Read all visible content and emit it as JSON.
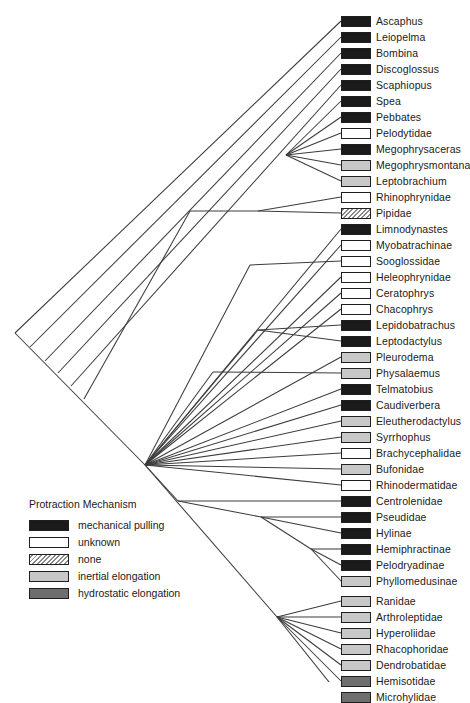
{
  "figure": {
    "type": "phylogenetic-tree-cladogram",
    "width": 464,
    "height": 682
  },
  "legend": {
    "title": "Protraction Mechanism",
    "items": [
      {
        "key": "mechanical-pulling",
        "label": "mechanical pulling",
        "color": "#1b1b1b",
        "pattern": "solid"
      },
      {
        "key": "unknown",
        "label": "unknown",
        "color": "#ffffff",
        "pattern": "solid"
      },
      {
        "key": "none",
        "label": "none",
        "color": "#ffffff",
        "pattern": "diagonal-hatch"
      },
      {
        "key": "inertial-elongation",
        "label": "inertial elongation",
        "color": "#c8c8c8",
        "pattern": "solid"
      },
      {
        "key": "hydrostatic-elongation",
        "label": "hydrostatic elongation",
        "color": "#6e6e6e",
        "pattern": "solid"
      }
    ]
  },
  "taxa": [
    {
      "label": "Ascaphus",
      "state": "mechanical-pulling",
      "x": 341,
      "y": 21
    },
    {
      "label": "Leiopelma",
      "state": "mechanical-pulling",
      "x": 341,
      "y": 37
    },
    {
      "label": "Bombina",
      "state": "mechanical-pulling",
      "x": 341,
      "y": 53
    },
    {
      "label": "Discoglossus",
      "state": "mechanical-pulling",
      "x": 341,
      "y": 69
    },
    {
      "label": "Scaphiopus",
      "state": "mechanical-pulling",
      "x": 341,
      "y": 85
    },
    {
      "label": "Spea",
      "state": "mechanical-pulling",
      "x": 341,
      "y": 101
    },
    {
      "label": "Pebbates",
      "state": "mechanical-pulling",
      "x": 341,
      "y": 117
    },
    {
      "label": "Pelodytidae",
      "state": "unknown",
      "x": 341,
      "y": 133
    },
    {
      "label": "Megophrysaceras",
      "state": "mechanical-pulling",
      "x": 341,
      "y": 149
    },
    {
      "label": "Megophrysmontana",
      "state": "inertial-elongation",
      "x": 341,
      "y": 165
    },
    {
      "label": "Leptobrachium",
      "state": "inertial-elongation",
      "x": 341,
      "y": 181
    },
    {
      "label": "Rhinophrynidae",
      "state": "unknown",
      "x": 341,
      "y": 197
    },
    {
      "label": "Pipidae",
      "state": "none",
      "x": 341,
      "y": 213
    },
    {
      "label": "Limnodynastes",
      "state": "mechanical-pulling",
      "x": 341,
      "y": 229
    },
    {
      "label": "Myobatrachinae",
      "state": "unknown",
      "x": 341,
      "y": 245
    },
    {
      "label": "Sooglossidae",
      "state": "unknown",
      "x": 341,
      "y": 261
    },
    {
      "label": "Heleophrynidae",
      "state": "unknown",
      "x": 341,
      "y": 277
    },
    {
      "label": "Ceratophrys",
      "state": "unknown",
      "x": 341,
      "y": 293
    },
    {
      "label": "Chacophrys",
      "state": "unknown",
      "x": 341,
      "y": 309
    },
    {
      "label": "Lepidobatrachus",
      "state": "mechanical-pulling",
      "x": 341,
      "y": 325
    },
    {
      "label": "Leptodactylus",
      "state": "mechanical-pulling",
      "x": 341,
      "y": 341
    },
    {
      "label": "Pleurodema",
      "state": "inertial-elongation",
      "x": 341,
      "y": 357
    },
    {
      "label": "Physalaemus",
      "state": "inertial-elongation",
      "x": 341,
      "y": 373
    },
    {
      "label": "Telmatobius",
      "state": "mechanical-pulling",
      "x": 341,
      "y": 389
    },
    {
      "label": "Caudiverbera",
      "state": "mechanical-pulling",
      "x": 341,
      "y": 405
    },
    {
      "label": "Eleutherodactylus",
      "state": "inertial-elongation",
      "x": 341,
      "y": 421
    },
    {
      "label": "Syrrhophus",
      "state": "inertial-elongation",
      "x": 341,
      "y": 437
    },
    {
      "label": "Brachycephalidae",
      "state": "unknown",
      "x": 341,
      "y": 453
    },
    {
      "label": "Bufonidae",
      "state": "inertial-elongation",
      "x": 341,
      "y": 469
    },
    {
      "label": "Rhinodermatidae",
      "state": "unknown",
      "x": 341,
      "y": 485
    },
    {
      "label": "Centrolenidae",
      "state": "mechanical-pulling",
      "x": 341,
      "y": 501
    },
    {
      "label": "Pseudidae",
      "state": "mechanical-pulling",
      "x": 341,
      "y": 517
    },
    {
      "label": "Hylinae",
      "state": "mechanical-pulling",
      "x": 341,
      "y": 533
    },
    {
      "label": "Hemiphractinae",
      "state": "mechanical-pulling",
      "x": 341,
      "y": 549
    },
    {
      "label": "Pelodryadinae",
      "state": "mechanical-pulling",
      "x": 341,
      "y": 565
    },
    {
      "label": "Phyllomedusinae",
      "state": "inertial-elongation",
      "x": 341,
      "y": 581
    },
    {
      "label": "Ranidae",
      "state": "inertial-elongation",
      "x": 341,
      "y": 601
    },
    {
      "label": "Arthroleptidae",
      "state": "inertial-elongation",
      "x": 341,
      "y": 617
    },
    {
      "label": "Hyperoliidae",
      "state": "inertial-elongation",
      "x": 341,
      "y": 633
    },
    {
      "label": "Rhacophoridae",
      "state": "inertial-elongation",
      "x": 341,
      "y": 649
    },
    {
      "label": "Dendrobatidae",
      "state": "inertial-elongation",
      "x": 341,
      "y": 665
    },
    {
      "label": "Hemisotidae",
      "state": "hydrostatic-elongation",
      "x": 341,
      "y": 681
    },
    {
      "label": "Microhylidae",
      "state": "hydrostatic-elongation",
      "x": 341,
      "y": 697
    }
  ],
  "tree_edges": [
    "root(15,333)->basal-ladder",
    "node-archaeobatrachia(190,211)",
    "node-pipoidea(258,211)",
    "node-megophryidae(286,155)",
    "node-neobatrachia(145,465)",
    "node-ranoidea(277,617)"
  ]
}
